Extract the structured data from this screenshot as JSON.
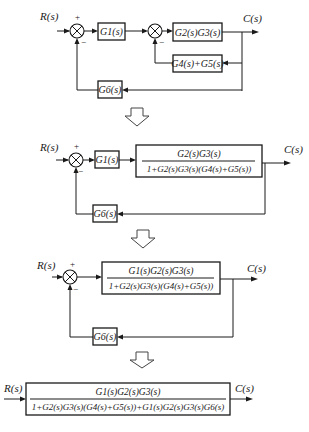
{
  "diagrams": [
    {
      "input": "R(s)",
      "output": "C(s)",
      "sum1_signs": {
        "plus": "+",
        "minus": "−"
      },
      "sum2_signs": {
        "minus": "−"
      },
      "blocks": {
        "g1": "G1(s)",
        "g2g3": "G2(s)G3(s)",
        "g4g5": "G4(s)+G5(s)",
        "g6": "G6(s)"
      }
    },
    {
      "input": "R(s)",
      "output": "C(s)",
      "sum1_signs": {
        "plus": "+",
        "minus": "−"
      },
      "blocks": {
        "g1": "G1(s)",
        "inner_num": "G2(s)G3(s)",
        "inner_den": "1+G2(s)G3(s)(G4(s)+G5(s))",
        "g6": "G6(s)"
      }
    },
    {
      "input": "R(s)",
      "output": "C(s)",
      "sum1_signs": {
        "plus": "+",
        "minus": "−"
      },
      "blocks": {
        "forward_num": "G1(s)G2(s)G3(s)",
        "forward_den": "1+G2(s)G3(s)(G4(s)+G5(s))",
        "g6": "G6(s)"
      }
    },
    {
      "input": "R(s)",
      "output": "C(s)",
      "blocks": {
        "closed_num": "G1(s)G2(s)G3(s)",
        "closed_den": "1+G2(s)G3(s)(G4(s)+G5(s))+G1(s)G2(s)G3(s)G6(s)"
      }
    }
  ],
  "transition_arrows": [
    "down-arrow",
    "down-arrow",
    "down-arrow"
  ]
}
